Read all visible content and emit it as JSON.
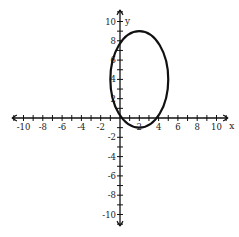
{
  "chart_data": {
    "type": "line",
    "title": "",
    "xlabel": "x",
    "ylabel": "y",
    "xlim": [
      -11,
      11
    ],
    "ylim": [
      -11,
      11
    ],
    "grid": false,
    "x_tick_labels": [
      "-10",
      "-8",
      "-6",
      "-4",
      "-2",
      "2",
      "4",
      "6",
      "8",
      "10"
    ],
    "x_tick_values": [
      -10,
      -8,
      -6,
      -4,
      -2,
      2,
      4,
      6,
      8,
      10
    ],
    "y_tick_labels": [
      "10",
      "8",
      "6",
      "4",
      "2",
      "-2",
      "-4",
      "-6",
      "-8",
      "-10"
    ],
    "y_tick_values": [
      10,
      8,
      6,
      4,
      2,
      -2,
      -4,
      -6,
      -8,
      -10
    ],
    "series": [
      {
        "name": "ellipse",
        "shape": "ellipse",
        "center": [
          2,
          4
        ],
        "rx": 3,
        "ry": 5,
        "equation": "(x-2)^2/9 + (y-4)^2/25 = 1",
        "color": "#111111"
      }
    ]
  },
  "axes": {
    "x_label": "x",
    "y_label": "y"
  }
}
